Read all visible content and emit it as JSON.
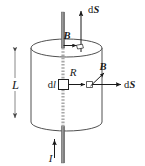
{
  "figure": {
    "type": "physics-diagram",
    "colors": {
      "outline": "#3c3c3c",
      "wire": "#8a8a8a",
      "wire_dashed": "#a8a8a8",
      "arrow": "#1a1a1a",
      "label": "#1a1a1a",
      "background": "#ffffff"
    },
    "labels": {
      "length": "L",
      "current": "I",
      "radius": "R",
      "element": "dl",
      "field_top": "B",
      "field_side": "B",
      "area_top": "dS",
      "area_side": "dS",
      "d_prefix": "d",
      "S_symbol": "S",
      "l_symbol": "l"
    },
    "elements": {
      "cylinder": "vertical circular cylinder of height L and radius R",
      "wire": "straight vertical wire along the cylinder axis carrying current I upward",
      "top_ellipse": "cylinder top face shown as an ellipse",
      "bottom_arc": "cylinder bottom face shown as an arc",
      "dimension_arrow": "double-headed vertical arrow marking the height L",
      "current_arrow": "upward arrow at the bottom labelled I",
      "dS_top_arrow": "upward vector arrow on the top face labelled dS",
      "dS_side_arrow": "rightward (outward radial) vector arrow on the side labelled dS",
      "B_top_arrow": "short rightward arrow at the top face labelled B",
      "B_side_arrow": "short diagonal up-right arrow at mid-height labelled B",
      "dl_square": "small open square denoting the line element dl on the wire",
      "patch_top": "small square patch of area on the top face",
      "patch_side": "small square patch of area on the cylinder side"
    }
  }
}
